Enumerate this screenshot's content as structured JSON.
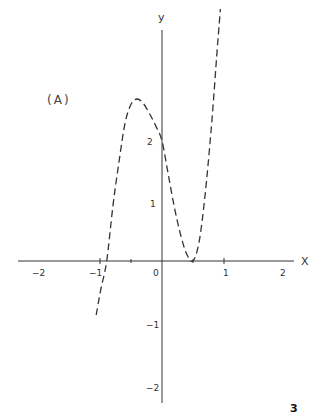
{
  "chart_data": {
    "type": "line",
    "title": "",
    "panel_label": "(A)",
    "xlabel": "X",
    "ylabel": "y",
    "xlim": [
      -2.3,
      2.15
    ],
    "ylim": [
      -2.3,
      3.85
    ],
    "x_ticks": [
      -2,
      -1,
      0,
      1,
      2
    ],
    "y_ticks": [
      -2,
      -1,
      1,
      2
    ],
    "x_tick_labels": [
      "−2",
      "−1",
      "0",
      "1",
      "2"
    ],
    "y_tick_labels": [
      "−2",
      "−1",
      "1",
      "2"
    ],
    "grid": false,
    "legend": null,
    "series": [
      {
        "name": "curve",
        "style": "dashed",
        "x": [
          -1.07,
          -1.0,
          -0.9,
          -0.8,
          -0.7,
          -0.6,
          -0.5,
          -0.4,
          -0.3,
          -0.2,
          -0.1,
          0.0,
          0.1,
          0.2,
          0.3,
          0.4,
          0.5,
          0.6,
          0.7,
          0.8,
          0.9,
          0.95
        ],
        "y": [
          -0.9,
          -0.5,
          0.0,
          0.9,
          1.65,
          2.3,
          2.62,
          2.7,
          2.62,
          2.45,
          2.25,
          2.0,
          1.45,
          0.9,
          0.45,
          0.12,
          0.0,
          0.3,
          1.1,
          2.2,
          3.55,
          4.2
        ]
      }
    ],
    "annotations": [
      {
        "text": "(A)",
        "x": -1.5,
        "y": 2.7
      }
    ],
    "page_marker": "3"
  },
  "labels": {
    "panel": "(A)",
    "x_axis": "X",
    "y_axis": "y",
    "x_ticks": [
      "−2",
      "−1",
      "0",
      "1",
      "2"
    ],
    "y_ticks": [
      "2",
      "1",
      "−1",
      "−2"
    ],
    "page_number": "3"
  }
}
